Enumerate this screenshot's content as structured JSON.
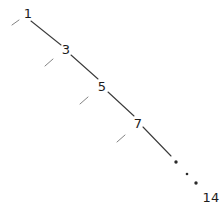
{
  "figure": {
    "kind": "chain-path-diagram",
    "background_color": "#ffffff",
    "line_color": "#3a3a3a",
    "label_color": "#1c1c1c",
    "tick_color": "#6e6e6e",
    "dot_color": "#2a2a2a",
    "width": 223,
    "height": 216
  },
  "nodes": [
    {
      "id": "n1",
      "label": "1",
      "x": 28,
      "y": 13
    },
    {
      "id": "n3",
      "label": "3",
      "x": 66,
      "y": 49
    },
    {
      "id": "n5",
      "label": "5",
      "x": 102,
      "y": 86
    },
    {
      "id": "n7",
      "label": "7",
      "x": 138,
      "y": 123
    },
    {
      "id": "n14",
      "label": "14",
      "x": 211,
      "y": 197
    }
  ],
  "edges": [
    {
      "id": "e1",
      "from": "1",
      "to": "3",
      "x1": 31,
      "y1": 21,
      "x2": 61,
      "y2": 45
    },
    {
      "id": "e2",
      "from": "3",
      "to": "5",
      "x1": 71,
      "y1": 55,
      "x2": 98,
      "y2": 79
    },
    {
      "id": "e3",
      "from": "5",
      "to": "7",
      "x1": 108,
      "y1": 92,
      "x2": 134,
      "y2": 116
    },
    {
      "id": "e4",
      "from": "7",
      "to": "…",
      "x1": 143,
      "y1": 127,
      "x2": 171,
      "y2": 156
    }
  ],
  "edge_ticks": [
    {
      "id": "t1",
      "x1": 12,
      "y1": 25,
      "x2": 19,
      "y2": 20
    },
    {
      "id": "t2",
      "x1": 45,
      "y1": 66,
      "x2": 53,
      "y2": 59
    },
    {
      "id": "t3",
      "x1": 80,
      "y1": 104,
      "x2": 88,
      "y2": 97
    },
    {
      "id": "t4",
      "x1": 117,
      "y1": 142,
      "x2": 125,
      "y2": 135
    }
  ],
  "ellipsis_dots": [
    {
      "id": "d1",
      "x": 176,
      "y": 162,
      "r": 1.7
    },
    {
      "id": "d2",
      "x": 187,
      "y": 174,
      "r": 1.3
    },
    {
      "id": "d3",
      "x": 196,
      "y": 183,
      "r": 1.7
    }
  ]
}
